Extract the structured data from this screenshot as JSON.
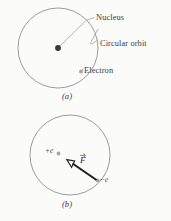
{
  "figure": {
    "background_color": "#fbfbfa",
    "ink_color": "#3a3a3c",
    "orbit_stroke_color": "#8c8a8b",
    "nucleus_color": "#3b383a",
    "electron_color": "#a9a6a7",
    "leader_color": "#9b9899",
    "force_vector_color": "#1f1e1f"
  },
  "panel_a": {
    "caption": "(a)",
    "callouts": [
      {
        "key": "nucleus",
        "label": "Nucleus"
      },
      {
        "key": "circular_orbit",
        "label": "Circular orbit"
      },
      {
        "key": "electron",
        "label": "Electron"
      }
    ]
  },
  "panel_b": {
    "caption": "(b)",
    "charges": [
      {
        "key": "nucleus_charge",
        "label": "+e"
      },
      {
        "key": "electron_charge",
        "label": "−e"
      }
    ],
    "vector": {
      "key": "coulomb_force",
      "label": "F"
    }
  }
}
